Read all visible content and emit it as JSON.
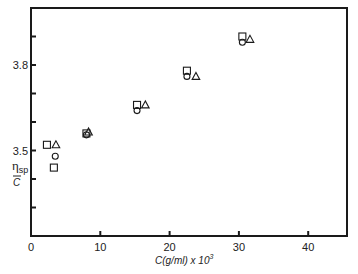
{
  "chart_data": {
    "type": "scatter",
    "title": "",
    "xlabel": "C(g/ml) x 10^3",
    "xlabel_parts": {
      "main": "C(g/ml) x 10",
      "sup": "3"
    },
    "ylabel": "ηsp / C",
    "ylabel_parts": {
      "eta": "η",
      "sub": "sp",
      "denom": "C"
    },
    "xlim": [
      0,
      45
    ],
    "ylim": [
      3.2,
      4.0
    ],
    "x_ticks": [
      0,
      10,
      20,
      30,
      40
    ],
    "x_tick_labels": [
      "0",
      "10",
      "20",
      "30",
      "40"
    ],
    "y_ticks": [
      3.3,
      3.4,
      3.5,
      3.6,
      3.7,
      3.8,
      3.9
    ],
    "y_tick_labels": {
      "3.5": "3.5",
      "3.8": "3.8"
    },
    "grid": false,
    "legend": null,
    "series": [
      {
        "name": "square",
        "marker": "square",
        "points": [
          [
            2.3,
            3.52
          ],
          [
            3.3,
            3.44
          ],
          [
            8.0,
            3.56
          ],
          [
            15.3,
            3.66
          ],
          [
            22.5,
            3.78
          ],
          [
            30.5,
            3.9
          ]
        ]
      },
      {
        "name": "circle",
        "marker": "circle",
        "points": [
          [
            3.5,
            3.48
          ],
          [
            8.0,
            3.555
          ],
          [
            15.3,
            3.64
          ],
          [
            22.5,
            3.76
          ],
          [
            30.5,
            3.88
          ]
        ]
      },
      {
        "name": "triangle",
        "marker": "triangle",
        "points": [
          [
            3.6,
            3.52
          ],
          [
            8.3,
            3.565
          ],
          [
            16.5,
            3.66
          ],
          [
            23.8,
            3.76
          ],
          [
            31.6,
            3.89
          ]
        ]
      }
    ]
  }
}
